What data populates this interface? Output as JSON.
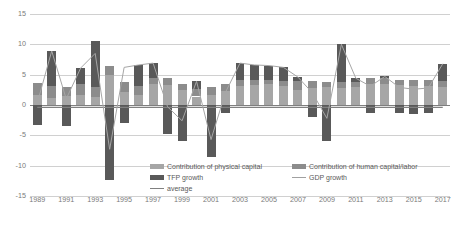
{
  "chart_data": {
    "type": "bar",
    "title": "",
    "subtitle": "",
    "xlabel": "",
    "ylabel": "",
    "ylim": [
      -15,
      15
    ],
    "yticks": [
      15,
      10,
      5,
      0,
      -5,
      -10,
      -15
    ],
    "grid": true,
    "legend_position": "bottom",
    "stacked": true,
    "categories": [
      "1989",
      "1990",
      "1991",
      "1992",
      "1993",
      "1994",
      "1995",
      "1996",
      "1997",
      "1998",
      "1999",
      "2000",
      "2001",
      "2002",
      "2003",
      "2004",
      "2005",
      "2006",
      "2007",
      "2008",
      "2009",
      "2010",
      "2011",
      "2012",
      "2013",
      "2014",
      "2015",
      "2016",
      "2017"
    ],
    "xtick_labels": [
      "1989",
      "1991",
      "1993",
      "1995",
      "1997",
      "1999",
      "2001",
      "2003",
      "2005",
      "2007",
      "2009",
      "2011",
      "2013",
      "2015",
      "2017"
    ],
    "series": [
      {
        "name": "Contribution of physical capital",
        "type": "bar",
        "color": "#a6a6a6",
        "values": [
          1.7,
          1.2,
          1.5,
          1.7,
          1.4,
          5.0,
          2.2,
          1.6,
          3.4,
          3.3,
          2.4,
          1.4,
          1.7,
          2.3,
          3.2,
          3.3,
          3.4,
          3.2,
          2.4,
          2.8,
          2.9,
          2.8,
          2.9,
          3.4,
          3.4,
          3.3,
          3.1,
          3.2,
          3.0
        ]
      },
      {
        "name": "Contribution of human capital/labor",
        "type": "bar",
        "color": "#8c8c8c",
        "values": [
          1.9,
          2.0,
          1.5,
          1.7,
          1.6,
          1.5,
          1.6,
          1.6,
          1.1,
          1.2,
          1.0,
          1.3,
          1.2,
          1.1,
          0.9,
          0.9,
          0.8,
          0.8,
          1.6,
          1.2,
          0.9,
          1.0,
          0.9,
          1.0,
          1.0,
          0.9,
          1.0,
          0.9,
          0.9
        ]
      },
      {
        "name": "TFP growth",
        "type": "bar",
        "color": "#595959",
        "values": [
          -3.3,
          5.7,
          -3.4,
          2.7,
          7.5,
          -12.3,
          -2.9,
          3.4,
          2.4,
          -4.8,
          -6.0,
          1.2,
          -8.6,
          -1.3,
          2.8,
          2.4,
          2.3,
          2.2,
          0.6,
          -2.0,
          -6.0,
          6.2,
          0.6,
          -1.3,
          0.3,
          -1.3,
          -1.5,
          -1.3,
          2.9
        ]
      },
      {
        "name": "GDP growth",
        "type": "line",
        "color": "#a6a6a6",
        "values": [
          0.3,
          8.9,
          1.0,
          6.1,
          8.5,
          -7.3,
          6.2,
          6.6,
          6.9,
          -0.3,
          -2.6,
          3.9,
          -5.7,
          2.1,
          6.9,
          6.6,
          6.5,
          6.2,
          4.6,
          2.0,
          -2.2,
          10.0,
          4.4,
          3.1,
          4.7,
          2.9,
          2.6,
          2.8,
          6.8
        ]
      },
      {
        "name": "average",
        "type": "line",
        "color": "#808080",
        "values": [
          -0.4,
          -0.4,
          -0.4,
          -0.4,
          -0.4,
          -0.4,
          -0.4,
          -0.4,
          -0.4,
          -0.4,
          -0.4,
          -0.4,
          -0.4,
          -0.4,
          -0.4,
          -0.4,
          -0.4,
          -0.4,
          -0.4,
          -0.4,
          -0.4,
          -0.4,
          -0.4,
          -0.4,
          -0.4,
          -0.4,
          -0.4,
          -0.4,
          -0.4
        ]
      }
    ],
    "legend": [
      {
        "label": "Contribution of physical capital",
        "marker": "swatch",
        "color": "#a6a6a6"
      },
      {
        "label": "TFP growth",
        "marker": "swatch",
        "color": "#595959"
      },
      {
        "label": "average",
        "marker": "line",
        "color": "#808080"
      },
      {
        "label": "Contribution of human capital/labor",
        "marker": "swatch",
        "color": "#8c8c8c"
      },
      {
        "label": "GDP growth",
        "marker": "line",
        "color": "#a6a6a6"
      }
    ]
  }
}
